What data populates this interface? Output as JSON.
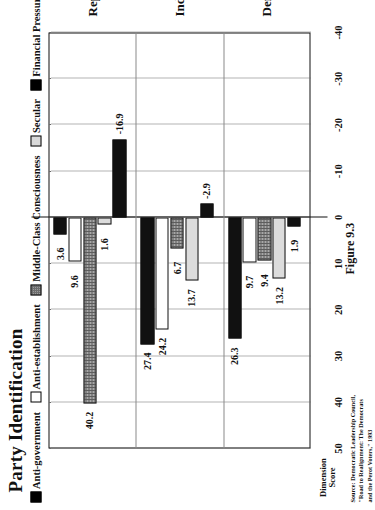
{
  "title": "Party Identification",
  "figure_caption": "Figure 9.3",
  "source_lines": [
    "Source: Democratic Leadership Council,",
    "\"Road to Realignment:  The  Democrats",
    "and the Perot Voters,\"  1993"
  ],
  "axis_title_lines": [
    "Dimension",
    "Score"
  ],
  "legend": [
    {
      "label": "Anti-government",
      "swatch": "black"
    },
    {
      "label": "Anti-establishment",
      "swatch": "white"
    },
    {
      "label": "Middle-Class Consciousness",
      "swatch": "hatch"
    },
    {
      "label": "Secular",
      "swatch": "lgray"
    },
    {
      "label": "Financial Pressure",
      "swatch": "black"
    }
  ],
  "chart_data": {
    "type": "bar",
    "orientation": "horizontal",
    "title": "Party Identification",
    "xlabel": "Dimension Score",
    "ylabel": "",
    "categories": [
      "Democrat",
      "Independent",
      "Republican"
    ],
    "ticks": [
      50,
      40,
      30,
      20,
      10,
      0,
      -10,
      -20,
      -30,
      -40
    ],
    "xlim": [
      -40,
      50
    ],
    "grid": true,
    "legend_position": "top",
    "series": [
      {
        "name": "Anti-government",
        "style": "black",
        "values": [
          26.3,
          27.4,
          3.6
        ]
      },
      {
        "name": "Anti-establishment",
        "style": "white",
        "values": [
          9.7,
          24.2,
          9.6
        ]
      },
      {
        "name": "Middle-Class Consciousness",
        "style": "hatch",
        "values": [
          9.4,
          6.7,
          40.2
        ]
      },
      {
        "name": "Secular",
        "style": "lgray",
        "values": [
          13.2,
          13.7,
          1.6
        ]
      },
      {
        "name": "Financial Pressure",
        "style": "black",
        "values": [
          1.9,
          -2.9,
          -16.9
        ]
      }
    ],
    "point_labels": {
      "Democrat": [
        "26.3",
        "9.7",
        "9.4",
        "13.2",
        "1.9"
      ],
      "Independent": [
        "27.4",
        "24.2",
        "6.7",
        "13.7",
        "-2.9"
      ],
      "Republican": [
        "3.6",
        "9.6",
        "40.2",
        "1.6",
        "-16.9"
      ]
    }
  }
}
